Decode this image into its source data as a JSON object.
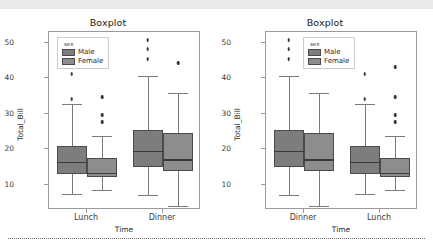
{
  "figure": {
    "background": "#ffffff",
    "top_band_color": "#e9e9e9",
    "colors": {
      "male": "#7d7d7d",
      "female": "#8d8d8d",
      "frame": "#9a9a9a",
      "text": "#2a2a2a"
    }
  },
  "panels": [
    {
      "title": "Boxplot",
      "xlabel": "Time",
      "ylabel": "Total_Bill",
      "legend": {
        "title": "sex",
        "entries": [
          "Male",
          "Female"
        ]
      }
    },
    {
      "title": "Boxplot",
      "xlabel": "Time",
      "ylabel": "Total_Bill",
      "legend": {
        "title": "sex",
        "entries": [
          "Male",
          "Female"
        ]
      }
    }
  ],
  "yticks": [
    "50",
    "40",
    "30",
    "20",
    "10"
  ],
  "chart_data": [
    {
      "type": "box",
      "title": "Boxplot",
      "xlabel": "Time",
      "ylabel": "Total_Bill",
      "categories": [
        "Lunch",
        "Dinner"
      ],
      "legend_title": "sex",
      "legend_position": "upper left",
      "ylim": [
        3,
        53
      ],
      "grid": false,
      "series": [
        {
          "name": "Male",
          "boxes": [
            {
              "category": "Lunch",
              "whisker_low": 7.5,
              "q1": 13.2,
              "median": 16.6,
              "q3": 21.0,
              "whisker_high": 32.7,
              "fliers": [
                34.3,
                41.2
              ]
            },
            {
              "category": "Dinner",
              "whisker_low": 7.3,
              "q1": 15.0,
              "median": 19.6,
              "q3": 25.4,
              "whisker_high": 40.7,
              "fliers": [
                45.3,
                48.2,
                50.8
              ]
            }
          ]
        },
        {
          "name": "Female",
          "boxes": [
            {
              "category": "Lunch",
              "whisker_low": 8.6,
              "q1": 12.2,
              "median": 13.4,
              "q3": 17.7,
              "whisker_high": 23.9,
              "fliers": [
                27.8,
                29.8,
                34.8,
                43.1
              ]
            },
            {
              "category": "Dinner",
              "whisker_low": 4.0,
              "q1": 14.0,
              "median": 17.2,
              "q3": 24.5,
              "whisker_high": 35.8,
              "fliers": [
                44.3
              ]
            }
          ]
        }
      ]
    },
    {
      "type": "box",
      "title": "Boxplot",
      "xlabel": "Time",
      "ylabel": "Total_Bill",
      "categories": [
        "Dinner",
        "Lunch"
      ],
      "legend_title": "sex",
      "legend_position": "upper center",
      "ylim": [
        3,
        53
      ],
      "grid": false,
      "series": [
        {
          "name": "Male",
          "boxes": [
            {
              "category": "Dinner",
              "whisker_low": 7.3,
              "q1": 15.0,
              "median": 19.6,
              "q3": 25.4,
              "whisker_high": 40.7,
              "fliers": [
                45.3,
                48.2,
                50.8
              ]
            },
            {
              "category": "Lunch",
              "whisker_low": 7.5,
              "q1": 13.2,
              "median": 16.6,
              "q3": 21.0,
              "whisker_high": 32.7,
              "fliers": [
                34.3,
                41.2
              ]
            }
          ]
        },
        {
          "name": "Female",
          "boxes": [
            {
              "category": "Dinner",
              "whisker_low": 4.0,
              "q1": 14.0,
              "median": 17.2,
              "q3": 24.5,
              "whisker_high": 35.8,
              "fliers": [
                44.3
              ]
            },
            {
              "category": "Lunch",
              "whisker_low": 8.6,
              "q1": 12.2,
              "median": 13.4,
              "q3": 17.7,
              "whisker_high": 23.9,
              "fliers": [
                27.8,
                29.8,
                34.8,
                43.1
              ]
            }
          ]
        }
      ]
    }
  ]
}
